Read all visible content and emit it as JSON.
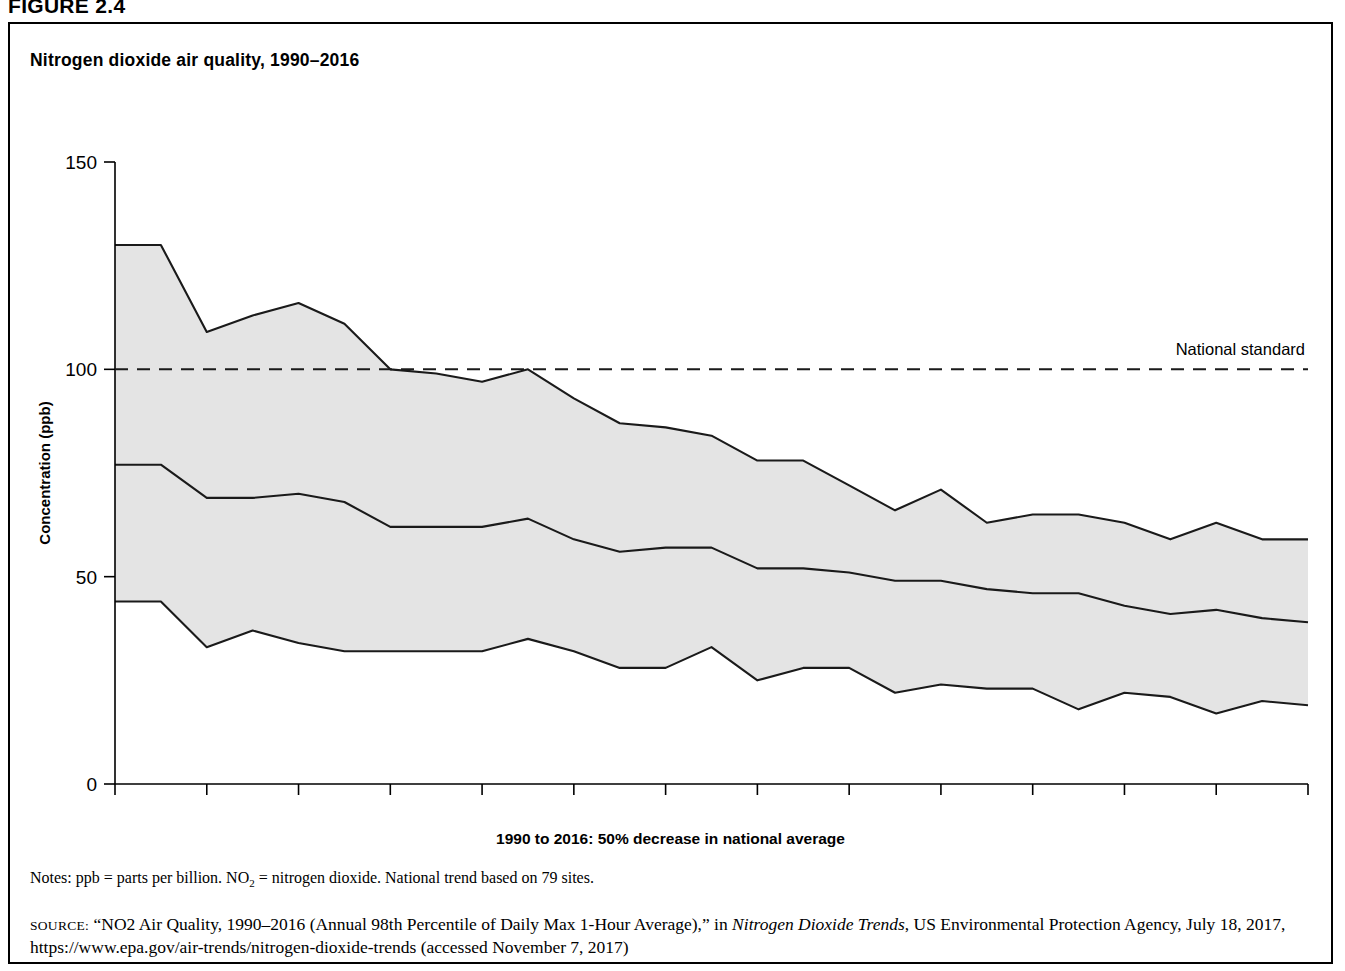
{
  "figure_label": "FIGURE 2.4",
  "chart_title": "Nitrogen dioxide air quality, 1990–2016",
  "x_caption": "1990 to 2016: 50% decrease in national average",
  "notes_prefix": "Notes: ppb = parts per billion. NO",
  "notes_sub": "2",
  "notes_suffix": " = nitrogen dioxide. National trend based on 79 sites.",
  "source_label": "SOURCE:",
  "source_text_1": " “NO2 Air Quality, 1990–2016 (Annual 98th Percentile of Daily Max 1-Hour Average),” in ",
  "source_italic": "Nitrogen Dioxide Trends",
  "source_text_2": ", US Environmental Protection Agency, July 18, 2017, https://www.epa.gov/air-trends/nitrogen-dioxide-trends (accessed November 7, 2017)",
  "colors": {
    "band_fill": "#e4e4e4",
    "line": "#1a1a1a",
    "frame": "#000000",
    "background": "#ffffff"
  },
  "chart_data": {
    "type": "area",
    "title": "Nitrogen dioxide air quality, 1990–2016",
    "xlabel": "1990 to 2016: 50% decrease in national average",
    "ylabel": "Concentration (ppb)",
    "ylim": [
      0,
      150
    ],
    "xlim": [
      1990,
      2016
    ],
    "grid": false,
    "legend_position": "none",
    "y_ticks": [
      0,
      50,
      100,
      150
    ],
    "y_tick_labels": [
      "0",
      "50",
      "100",
      "150"
    ],
    "x_ticks": [
      1990,
      1991,
      1992,
      1993,
      1994,
      1995,
      1996,
      1997,
      1998,
      1999,
      2000,
      2001,
      2002,
      2003,
      2004,
      2005,
      2006,
      2007,
      2008,
      2009,
      2010,
      2011,
      2012,
      2013,
      2014,
      2015,
      2016
    ],
    "x_tick_labels": [
      "1990",
      "",
      "1992",
      "",
      "1994",
      "",
      "1996",
      "",
      "1998",
      "",
      "2000",
      "",
      "2002",
      "",
      "2004",
      "",
      "2006",
      "",
      "2008",
      "",
      "2010",
      "",
      "2012",
      "",
      "2014",
      "",
      "2016"
    ],
    "x": [
      1990,
      1991,
      1992,
      1993,
      1994,
      1995,
      1996,
      1997,
      1998,
      1999,
      2000,
      2001,
      2002,
      2003,
      2004,
      2005,
      2006,
      2007,
      2008,
      2009,
      2010,
      2011,
      2012,
      2013,
      2014,
      2015,
      2016
    ],
    "series": [
      {
        "name": "90th percentile (upper bound of range)",
        "values": [
          130,
          130,
          109,
          113,
          116,
          111,
          100,
          99,
          97,
          100,
          93,
          87,
          86,
          84,
          78,
          78,
          72,
          66,
          71,
          63,
          65,
          65,
          63,
          59,
          63,
          59,
          59
        ]
      },
      {
        "name": "Mean / national average (middle line)",
        "values": [
          77,
          77,
          69,
          69,
          70,
          68,
          62,
          62,
          62,
          64,
          59,
          56,
          57,
          57,
          52,
          52,
          51,
          49,
          49,
          47,
          46,
          46,
          43,
          41,
          42,
          40,
          39
        ]
      },
      {
        "name": "10th percentile (lower bound of range)",
        "values": [
          44,
          44,
          33,
          37,
          34,
          32,
          32,
          32,
          32,
          35,
          32,
          28,
          28,
          33,
          25,
          28,
          28,
          22,
          24,
          23,
          23,
          18,
          22,
          21,
          17,
          20,
          19
        ]
      }
    ],
    "annotations": [
      {
        "label": "National standard",
        "type": "hline",
        "y": 100,
        "style": "dashed"
      }
    ]
  }
}
